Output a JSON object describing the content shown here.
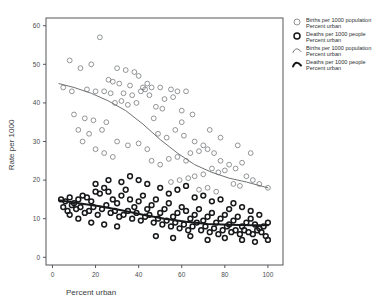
{
  "chart_data": {
    "type": "scatter",
    "title": "",
    "xlabel": "Percent urban",
    "ylabel": "Rate per 1000",
    "xlim": [
      -3,
      107
    ],
    "ylim": [
      -2,
      62
    ],
    "xticks": [
      0,
      20,
      40,
      60,
      80,
      100
    ],
    "yticks": [
      0,
      10,
      20,
      30,
      40,
      50,
      60
    ],
    "grid": false,
    "legend_position": "top-right-outside",
    "series": [
      {
        "name": "Births per 1000 population",
        "marker": "open-circle-thin",
        "color": "#6f7174",
        "points": [
          [
            22,
            57
          ],
          [
            8,
            51
          ],
          [
            13,
            49
          ],
          [
            18,
            50
          ],
          [
            30,
            49
          ],
          [
            34,
            48.5
          ],
          [
            38,
            48
          ],
          [
            40,
            47
          ],
          [
            26,
            46
          ],
          [
            28,
            45.5
          ],
          [
            31,
            45
          ],
          [
            36,
            44.5
          ],
          [
            42,
            44
          ],
          [
            44,
            45
          ],
          [
            46,
            44
          ],
          [
            5,
            44
          ],
          [
            9,
            43
          ],
          [
            16,
            43.5
          ],
          [
            20,
            43
          ],
          [
            24,
            43
          ],
          [
            27,
            42.5
          ],
          [
            33,
            42.5
          ],
          [
            37,
            42
          ],
          [
            41,
            43
          ],
          [
            43,
            43.5
          ],
          [
            45,
            42
          ],
          [
            50,
            44
          ],
          [
            55,
            43.5
          ],
          [
            58,
            43
          ],
          [
            62,
            43
          ],
          [
            52,
            41
          ],
          [
            56,
            41.5
          ],
          [
            29,
            40
          ],
          [
            32,
            40.5
          ],
          [
            35,
            39.5
          ],
          [
            39,
            40
          ],
          [
            48,
            39
          ],
          [
            51,
            38.5
          ],
          [
            10,
            37
          ],
          [
            15,
            36
          ],
          [
            19,
            35.5
          ],
          [
            25,
            35
          ],
          [
            47,
            36
          ],
          [
            60,
            38
          ],
          [
            65,
            37
          ],
          [
            12,
            33
          ],
          [
            17,
            32
          ],
          [
            23,
            33
          ],
          [
            49,
            32
          ],
          [
            53,
            31
          ],
          [
            57,
            33
          ],
          [
            61,
            31.5
          ],
          [
            30,
            30
          ],
          [
            35,
            29
          ],
          [
            40,
            29.5
          ],
          [
            44,
            28
          ],
          [
            66,
            30
          ],
          [
            70,
            29
          ],
          [
            64,
            27
          ],
          [
            68,
            27.5
          ],
          [
            72,
            28
          ],
          [
            75,
            27
          ],
          [
            58,
            26
          ],
          [
            62,
            25
          ],
          [
            54,
            25.5
          ],
          [
            46,
            25
          ],
          [
            50,
            24
          ],
          [
            78,
            25
          ],
          [
            82,
            24
          ],
          [
            85,
            23
          ],
          [
            88,
            24.5
          ],
          [
            74,
            23
          ],
          [
            77,
            22
          ],
          [
            80,
            22.5
          ],
          [
            66,
            21
          ],
          [
            70,
            21.5
          ],
          [
            59,
            20
          ],
          [
            63,
            20.5
          ],
          [
            55,
            19.5
          ],
          [
            90,
            21
          ],
          [
            93,
            20
          ],
          [
            96,
            19
          ],
          [
            100,
            18
          ],
          [
            84,
            19
          ],
          [
            87,
            18.5
          ],
          [
            72,
            18
          ],
          [
            68,
            17.5
          ],
          [
            76,
            17
          ],
          [
            60,
            35
          ],
          [
            73,
            33
          ],
          [
            78,
            31
          ],
          [
            86,
            29
          ],
          [
            92,
            27
          ],
          [
            20,
            28
          ],
          [
            24,
            27
          ],
          [
            28,
            26
          ],
          [
            14,
            30
          ]
        ]
      },
      {
        "name": "Deaths per 1000 people",
        "marker": "open-circle-bold",
        "color": "#17181a",
        "points": [
          [
            4,
            15
          ],
          [
            6,
            14.5
          ],
          [
            8,
            15.5
          ],
          [
            10,
            14
          ],
          [
            12,
            15
          ],
          [
            14,
            16
          ],
          [
            16,
            15.5
          ],
          [
            18,
            14.5
          ],
          [
            20,
            17
          ],
          [
            22,
            16.5
          ],
          [
            24,
            18
          ],
          [
            26,
            17
          ],
          [
            28,
            15
          ],
          [
            30,
            14
          ],
          [
            32,
            16
          ],
          [
            34,
            17.5
          ],
          [
            36,
            15
          ],
          [
            38,
            13
          ],
          [
            40,
            14.5
          ],
          [
            42,
            16
          ],
          [
            44,
            12.5
          ],
          [
            46,
            13.5
          ],
          [
            48,
            15
          ],
          [
            50,
            11.5
          ],
          [
            52,
            12.5
          ],
          [
            54,
            14
          ],
          [
            56,
            10.5
          ],
          [
            58,
            11.5
          ],
          [
            60,
            13
          ],
          [
            62,
            12
          ],
          [
            64,
            10
          ],
          [
            66,
            11
          ],
          [
            68,
            12.5
          ],
          [
            70,
            9.5
          ],
          [
            72,
            10.5
          ],
          [
            74,
            11.5
          ],
          [
            76,
            9
          ],
          [
            78,
            10
          ],
          [
            80,
            11
          ],
          [
            82,
            8.5
          ],
          [
            84,
            9.5
          ],
          [
            86,
            10.5
          ],
          [
            88,
            8
          ],
          [
            90,
            9
          ],
          [
            92,
            10
          ],
          [
            94,
            8.5
          ],
          [
            96,
            7.5
          ],
          [
            98,
            8
          ],
          [
            100,
            9
          ],
          [
            5,
            13
          ],
          [
            7,
            12
          ],
          [
            9,
            13.5
          ],
          [
            11,
            12.5
          ],
          [
            13,
            13
          ],
          [
            15,
            11.5
          ],
          [
            17,
            12
          ],
          [
            19,
            13
          ],
          [
            21,
            11
          ],
          [
            23,
            12.5
          ],
          [
            25,
            13.5
          ],
          [
            27,
            11.5
          ],
          [
            29,
            12
          ],
          [
            31,
            10.5
          ],
          [
            33,
            11
          ],
          [
            35,
            12
          ],
          [
            37,
            10
          ],
          [
            39,
            11.5
          ],
          [
            41,
            9.5
          ],
          [
            43,
            10.5
          ],
          [
            45,
            11
          ],
          [
            47,
            9
          ],
          [
            49,
            10
          ],
          [
            51,
            8.5
          ],
          [
            53,
            9.5
          ],
          [
            55,
            8
          ],
          [
            57,
            9
          ],
          [
            59,
            7.5
          ],
          [
            61,
            8.5
          ],
          [
            63,
            7
          ],
          [
            65,
            8
          ],
          [
            67,
            9
          ],
          [
            69,
            7
          ],
          [
            71,
            8
          ],
          [
            73,
            6.5
          ],
          [
            75,
            7.5
          ],
          [
            77,
            6
          ],
          [
            79,
            7
          ],
          [
            81,
            8
          ],
          [
            83,
            6.5
          ],
          [
            85,
            7
          ],
          [
            87,
            6
          ],
          [
            89,
            7
          ],
          [
            91,
            6.5
          ],
          [
            93,
            6
          ],
          [
            95,
            7
          ],
          [
            97,
            6.5
          ],
          [
            99,
            5.5
          ],
          [
            20,
            19
          ],
          [
            26,
            20
          ],
          [
            32,
            19.5
          ],
          [
            44,
            19
          ],
          [
            50,
            18
          ],
          [
            58,
            17.5
          ],
          [
            62,
            18.5
          ],
          [
            70,
            16
          ],
          [
            78,
            15
          ],
          [
            84,
            14
          ],
          [
            88,
            13
          ],
          [
            92,
            12
          ],
          [
            96,
            11
          ],
          [
            36,
            21
          ],
          [
            40,
            20
          ],
          [
            54,
            16.5
          ],
          [
            66,
            15.5
          ],
          [
            74,
            14.5
          ],
          [
            82,
            12.5
          ],
          [
            18,
            9
          ],
          [
            24,
            8.5
          ],
          [
            30,
            8
          ],
          [
            12,
            10
          ],
          [
            8,
            11
          ],
          [
            48,
            5.5
          ],
          [
            56,
            5
          ],
          [
            64,
            5.5
          ],
          [
            72,
            4.5
          ],
          [
            80,
            5
          ],
          [
            88,
            4.5
          ],
          [
            94,
            4
          ],
          [
            100,
            4.5
          ]
        ]
      }
    ],
    "fit_lines": [
      {
        "name": "Births per 1000 population",
        "style": "loess-thin",
        "color": "#6f7174",
        "points": [
          [
            3,
            45
          ],
          [
            10,
            44
          ],
          [
            18,
            42.5
          ],
          [
            26,
            40.5
          ],
          [
            34,
            38
          ],
          [
            42,
            34.5
          ],
          [
            50,
            30.5
          ],
          [
            58,
            27
          ],
          [
            66,
            24
          ],
          [
            74,
            22
          ],
          [
            82,
            20.5
          ],
          [
            90,
            19.5
          ],
          [
            100,
            18
          ]
        ]
      },
      {
        "name": "Deaths per 1000 people",
        "style": "loess-bold",
        "color": "#17181a",
        "points": [
          [
            3,
            14.8
          ],
          [
            12,
            14.0
          ],
          [
            22,
            13.2
          ],
          [
            32,
            12.2
          ],
          [
            42,
            11.0
          ],
          [
            52,
            10.0
          ],
          [
            62,
            9.2
          ],
          [
            72,
            8.6
          ],
          [
            82,
            8.4
          ],
          [
            92,
            8.3
          ],
          [
            100,
            8.3
          ]
        ]
      }
    ],
    "legend": [
      {
        "label_line1": "Births per 1000 population",
        "label_line2": "Percent urban",
        "marker": "circle-thin"
      },
      {
        "label_line1": "Deaths per 1000 people",
        "label_line2": "Percent urban",
        "marker": "circle-bold"
      },
      {
        "label_line1": "Births per 1000 population",
        "label_line2": "Percent urban",
        "marker": "curve-thin"
      },
      {
        "label_line1": "Deaths per 1000 people",
        "label_line2": "Percent urban",
        "marker": "curve-bold"
      }
    ]
  }
}
